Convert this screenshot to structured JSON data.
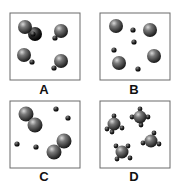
{
  "panels": [
    {
      "label": "A",
      "description": "Four diatomic molecules, each a large atom bonded to a small atom"
    },
    {
      "label": "B",
      "description": "Four separate large atoms and four separate small atoms (mixture of elements)"
    },
    {
      "label": "C",
      "description": "Two diatomic molecules of large atoms and four separate small atoms"
    },
    {
      "label": "D",
      "description": "Four molecules, each a large central atom bonded to four small atoms"
    }
  ],
  "colors": {
    "large_atom": "#3a3a3a",
    "small_atom": "#1a1a1a",
    "border": "#6a6a6a"
  }
}
